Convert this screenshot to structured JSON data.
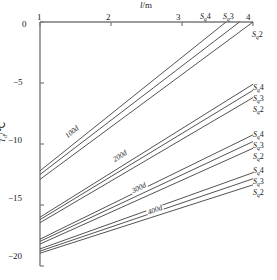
{
  "chart_data": {
    "type": "line",
    "title": "",
    "xlabel": "l/m",
    "ylabel": "Td/℃",
    "xlim": [
      1,
      4
    ],
    "ylim": [
      -20,
      0
    ],
    "xticks": [
      "1",
      "2",
      "3",
      "4"
    ],
    "xtick_values": [
      1,
      2,
      3,
      4
    ],
    "yticks": [
      "0",
      "−5",
      "−10",
      "−15",
      "−20"
    ],
    "ytick_values": [
      0,
      -5,
      -10,
      -15,
      -20
    ],
    "grid": false,
    "legend_position": "inline-right",
    "groups": [
      {
        "annotation": "100d",
        "annotation_x": 1.45,
        "annotation_y": -9.0,
        "series": [
          {
            "name": "Sq4",
            "x": [
              1,
              3.62
            ],
            "y": [
              -12.2,
              0
            ]
          },
          {
            "name": "Sq3",
            "x": [
              1,
              3.81
            ],
            "y": [
              -12.5,
              0
            ]
          },
          {
            "name": "Sq2",
            "x": [
              1,
              4.0
            ],
            "y": [
              -12.9,
              0
            ]
          }
        ]
      },
      {
        "annotation": "200d",
        "annotation_x": 2.12,
        "annotation_y": -11.0,
        "series": [
          {
            "name": "Sq4",
            "x": [
              1,
              4
            ],
            "y": [
              -16.0,
              -5.1
            ]
          },
          {
            "name": "Sq3",
            "x": [
              1,
              4
            ],
            "y": [
              -16.2,
              -5.6
            ]
          },
          {
            "name": "Sq2",
            "x": [
              1,
              4
            ],
            "y": [
              -16.45,
              -6.2
            ]
          }
        ]
      },
      {
        "annotation": "300d",
        "annotation_x": 2.4,
        "annotation_y": -13.6,
        "series": [
          {
            "name": "Sq4",
            "x": [
              1,
              4
            ],
            "y": [
              -17.8,
              -9.25
            ]
          },
          {
            "name": "Sq3",
            "x": [
              1,
              4
            ],
            "y": [
              -17.98,
              -9.8
            ]
          },
          {
            "name": "Sq2",
            "x": [
              1,
              4
            ],
            "y": [
              -18.2,
              -10.35
            ]
          }
        ]
      },
      {
        "annotation": "400d",
        "annotation_x": 2.62,
        "annotation_y": -15.4,
        "series": [
          {
            "name": "Sq4",
            "x": [
              1,
              4
            ],
            "y": [
              -18.6,
              -12.35
            ]
          },
          {
            "name": "Sq3",
            "x": [
              1,
              4
            ],
            "y": [
              -18.78,
              -12.85
            ]
          },
          {
            "name": "Sq2",
            "x": [
              1,
              4
            ],
            "y": [
              -18.95,
              -13.35
            ]
          }
        ]
      }
    ],
    "top_labels": [
      {
        "text": "Sq4",
        "x": 3.62
      },
      {
        "text": "Sq3",
        "x": 3.81
      }
    ],
    "colors": {
      "line": "#3f3f3f",
      "axis": "#7a7a7a",
      "text": "#1a1a1a"
    }
  },
  "axes": {
    "x_title": "l/m",
    "x_title_var": "l",
    "x_title_unit": "/m",
    "y_title_var": "T",
    "y_title_sub": "d",
    "y_title_unit": "/℃"
  },
  "series_label_parts": {
    "base": "S",
    "subscript": "q"
  },
  "series_labels": {
    "s4": "4",
    "s3": "3",
    "s2": "2"
  },
  "curve_annotations": {
    "d100": "100d",
    "d200": "200d",
    "d300": "300d",
    "d400": "400d"
  },
  "xticklabels": {
    "t1": "1",
    "t2": "2",
    "t3": "3",
    "t4": "4"
  },
  "yticklabels": {
    "t0": "0",
    "tm5": "−5",
    "tm10": "−10",
    "tm15": "−15",
    "tm20": "−20"
  }
}
